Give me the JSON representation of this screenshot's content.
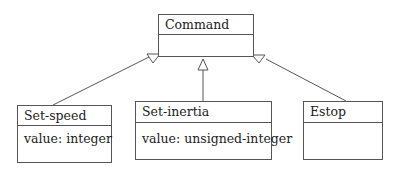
{
  "diagram": {
    "type": "uml-class-inheritance",
    "classes": [
      {
        "id": "command",
        "name": "Command",
        "attributes": []
      },
      {
        "id": "set-speed",
        "name": "Set-speed",
        "attributes": [
          "value: integer"
        ]
      },
      {
        "id": "set-inertia",
        "name": "Set-inertia",
        "attributes": [
          "value: unsigned-integer"
        ]
      },
      {
        "id": "estop",
        "name": "Estop",
        "attributes": []
      }
    ],
    "relations": [
      {
        "from": "set-speed",
        "to": "command",
        "kind": "generalization"
      },
      {
        "from": "set-inertia",
        "to": "command",
        "kind": "generalization"
      },
      {
        "from": "estop",
        "to": "command",
        "kind": "generalization"
      }
    ]
  }
}
